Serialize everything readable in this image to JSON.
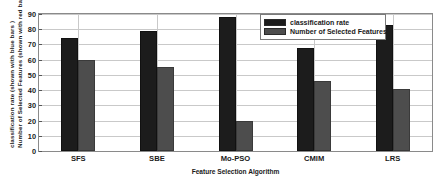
{
  "chart_data": {
    "type": "bar",
    "title": "",
    "categories": [
      "SFS",
      "SBE",
      "Mo-PSO",
      "CMIM",
      "LRS"
    ],
    "series": [
      {
        "name": "classification rate",
        "color": "#1c1c1c",
        "values": [
          74,
          79,
          88,
          68,
          83
        ]
      },
      {
        "name": "Number of Selected Features",
        "color": "#4d4d4d",
        "values": [
          60,
          55,
          20,
          46,
          41
        ]
      }
    ],
    "xlabel": "Feature Selection Algorithm",
    "ylabel_line1": "classification rate (shown with blue bars )",
    "ylabel_line2": "Number of Selected Features (shown with red bars)",
    "ylim": [
      0,
      90
    ],
    "yticks": [
      0,
      10,
      20,
      30,
      40,
      50,
      60,
      70,
      80,
      90
    ],
    "ytick_labels": [
      "0",
      "10",
      "20",
      "30",
      "40",
      "50",
      "60",
      "70",
      "80",
      "90"
    ],
    "grid": true,
    "legend_position": "top-right"
  }
}
